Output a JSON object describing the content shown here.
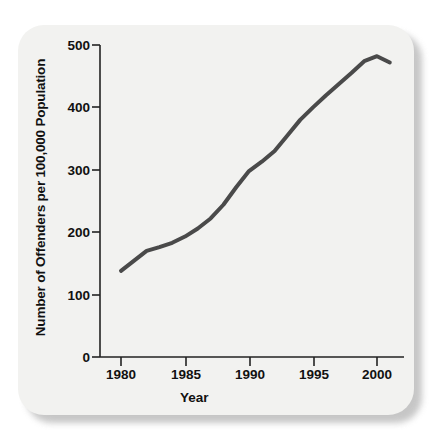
{
  "figure": {
    "background_color": "#f2f2f0",
    "page_color": "#ffffff"
  },
  "chart_data": {
    "type": "line",
    "title": "",
    "subtitle": "",
    "xlabel": "Year",
    "ylabel": "Number of Offenders per 100,000 Population",
    "xlim": [
      1979,
      2001.6
    ],
    "ylim": [
      0,
      500
    ],
    "grid": false,
    "legend": null,
    "line_color": "#4a4a4a",
    "line_width": 4,
    "xticks": [
      1980,
      1985,
      1990,
      1995,
      2000
    ],
    "xtick_labels": [
      "1980",
      "1985",
      "1990",
      "1995",
      "2000"
    ],
    "yticks": [
      0,
      100,
      200,
      300,
      400,
      500
    ],
    "ytick_labels": [
      "0",
      "100",
      "200",
      "300",
      "400",
      "500"
    ],
    "x": [
      1980,
      1981,
      1982,
      1983,
      1984,
      1985,
      1986,
      1987,
      1988,
      1989,
      1990,
      1991,
      1992,
      1993,
      1994,
      1995,
      1996,
      1997,
      1998,
      1999,
      2000,
      2001
    ],
    "values": [
      138,
      154,
      170,
      176,
      183,
      193,
      206,
      222,
      244,
      272,
      298,
      313,
      330,
      355,
      380,
      400,
      419,
      437,
      455,
      474,
      482,
      472
    ],
    "series": [
      {
        "name": "Offenders per 100,000 population",
        "values": [
          138,
          154,
          170,
          176,
          183,
          193,
          206,
          222,
          244,
          272,
          298,
          313,
          330,
          355,
          380,
          400,
          419,
          437,
          455,
          474,
          482,
          472
        ]
      }
    ],
    "annotations": []
  },
  "axes": {
    "x_axis_name": "year-axis",
    "y_axis_name": "offender-rate-axis"
  }
}
